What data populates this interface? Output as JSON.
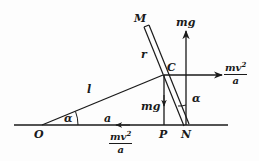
{
  "diagram": {
    "type": "physics-free-body-diagram",
    "points": {
      "O": "O",
      "C": "C",
      "P": "P",
      "N": "N",
      "M": "M"
    },
    "segments": {
      "rod_length": "r",
      "string_length": "l",
      "ground_distance": "a"
    },
    "angles": {
      "at_O": "α",
      "at_N": "α"
    },
    "forces": {
      "gravity_at_C": "mg",
      "normal_at_N": "mg",
      "centripetal_num": "mv",
      "centripetal_exp": "2",
      "centripetal_den": "a",
      "friction_num": "mv",
      "friction_exp": "2",
      "friction_den": "a"
    },
    "colors": {
      "ink": "#1a1a1a",
      "background": "#fdfdfd"
    }
  }
}
